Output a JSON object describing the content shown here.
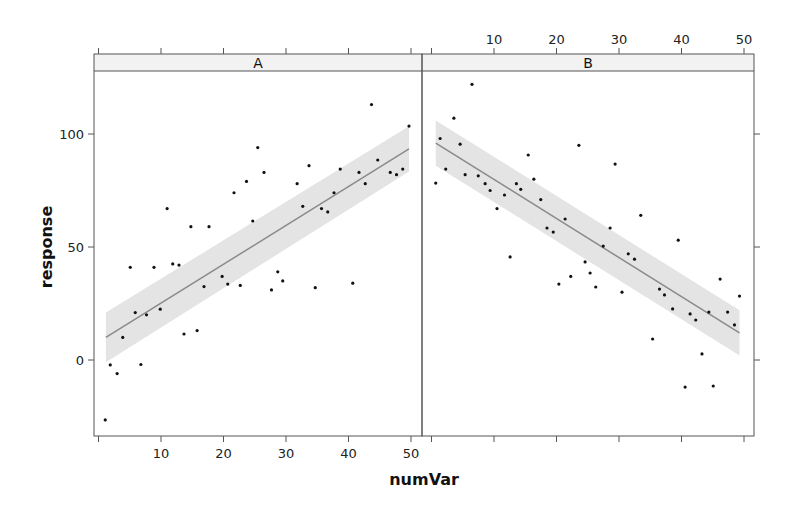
{
  "chart_data": {
    "type": "scatter",
    "layout": "lattice two-panel (facets side by side) with linear regression line and confidence band",
    "xlabel": "numVar",
    "ylabel": "response",
    "xlim": [
      0,
      52
    ],
    "ylim": [
      -30,
      128
    ],
    "x_ticks": [
      0,
      10,
      20,
      30,
      40,
      50
    ],
    "x_tick_labels": [
      "",
      "10",
      "20",
      "30",
      "40",
      "50"
    ],
    "y_ticks": [
      0,
      50,
      100
    ],
    "y_tick_labels": [
      "0",
      "50",
      "100"
    ],
    "grid": false,
    "colors": {
      "points": "#111111",
      "line": "#8a8a8a",
      "band": "#e4e4e4",
      "strip": "#f2f2f2",
      "frame": "#555555"
    },
    "panels": [
      {
        "label": "A",
        "fit": {
          "x": [
            1.5,
            50
          ],
          "y": [
            10,
            93.4
          ],
          "band_halfwidth": [
            11,
            10
          ]
        },
        "points": [
          [
            1.4,
            -26.5
          ],
          [
            2.2,
            -2.2
          ],
          [
            3.3,
            -6
          ],
          [
            4.2,
            10
          ],
          [
            5.4,
            41
          ],
          [
            6.2,
            21
          ],
          [
            7.1,
            -2
          ],
          [
            8,
            20
          ],
          [
            9.2,
            41
          ],
          [
            10.2,
            22.5
          ],
          [
            11.3,
            67
          ],
          [
            12.2,
            42.5
          ],
          [
            13.2,
            42
          ],
          [
            14,
            11.5
          ],
          [
            15.1,
            59
          ],
          [
            16.1,
            13
          ],
          [
            17.2,
            32.5
          ],
          [
            18,
            59
          ],
          [
            20.1,
            37
          ],
          [
            21,
            33.6
          ],
          [
            22,
            74
          ],
          [
            23,
            33
          ],
          [
            24,
            79
          ],
          [
            25,
            61.5
          ],
          [
            25.8,
            94
          ],
          [
            26.8,
            83
          ],
          [
            28,
            31
          ],
          [
            29,
            39
          ],
          [
            29.8,
            35
          ],
          [
            32.1,
            78
          ],
          [
            33,
            68
          ],
          [
            34,
            86
          ],
          [
            35,
            32
          ],
          [
            36,
            67
          ],
          [
            37,
            65.5
          ],
          [
            38,
            74
          ],
          [
            39,
            84.5
          ],
          [
            41,
            34
          ],
          [
            42,
            83
          ],
          [
            43,
            78
          ],
          [
            44,
            113
          ],
          [
            45,
            88.5
          ],
          [
            47,
            83
          ],
          [
            48,
            82
          ],
          [
            49,
            84.5
          ],
          [
            50,
            103.5
          ]
        ]
      },
      {
        "label": "B",
        "fit": {
          "x": [
            1,
            49.6
          ],
          "y": [
            96,
            12
          ],
          "band_halfwidth": [
            10,
            10
          ]
        },
        "points": [
          [
            1,
            78.3
          ],
          [
            1.7,
            98
          ],
          [
            2.6,
            84.5
          ],
          [
            3.9,
            107
          ],
          [
            4.9,
            95.5
          ],
          [
            5.7,
            82
          ],
          [
            6.8,
            122
          ],
          [
            7.8,
            81.5
          ],
          [
            8.9,
            78
          ],
          [
            9.7,
            75
          ],
          [
            10.8,
            67
          ],
          [
            12,
            73
          ],
          [
            12.9,
            45.6
          ],
          [
            13.9,
            78
          ],
          [
            14.6,
            75.5
          ],
          [
            15.8,
            90.7
          ],
          [
            16.7,
            80
          ],
          [
            17.8,
            71
          ],
          [
            18.8,
            58.4
          ],
          [
            19.8,
            56.6
          ],
          [
            20.7,
            33.6
          ],
          [
            21.7,
            62.4
          ],
          [
            22.6,
            37
          ],
          [
            23.9,
            95
          ],
          [
            24.9,
            43.4
          ],
          [
            25.7,
            38.5
          ],
          [
            26.6,
            32.3
          ],
          [
            27.8,
            50.4
          ],
          [
            28.9,
            58.4
          ],
          [
            29.7,
            86.7
          ],
          [
            30.8,
            30
          ],
          [
            31.8,
            47
          ],
          [
            32.8,
            44.6
          ],
          [
            33.8,
            64
          ],
          [
            35.7,
            9.3
          ],
          [
            36.8,
            31.4
          ],
          [
            37.6,
            28.8
          ],
          [
            38.9,
            22.6
          ],
          [
            39.8,
            53
          ],
          [
            40.9,
            -12
          ],
          [
            41.7,
            20.4
          ],
          [
            42.6,
            17.7
          ],
          [
            43.6,
            2.7
          ],
          [
            44.7,
            21.2
          ],
          [
            45.4,
            -11.5
          ],
          [
            46.5,
            35.8
          ],
          [
            47.7,
            21.2
          ],
          [
            48.8,
            15.5
          ],
          [
            49.6,
            28.3
          ]
        ]
      }
    ]
  }
}
